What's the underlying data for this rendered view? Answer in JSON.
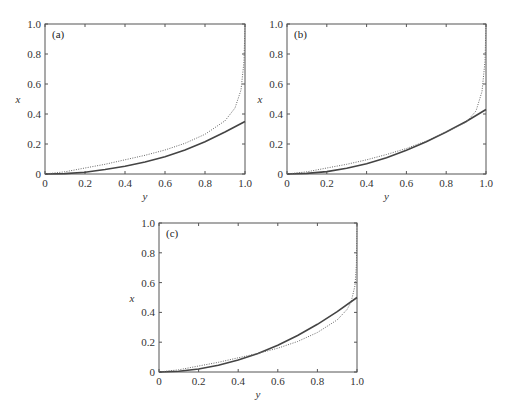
{
  "chart_data": [
    {
      "type": "line",
      "panel_label": "(a)",
      "xlabel": "y",
      "ylabel": "x",
      "xlim": [
        0,
        1.0
      ],
      "ylim": [
        0,
        1.0
      ],
      "x_ticks": [
        "0",
        "0.2",
        "0.4",
        "0.6",
        "0.8",
        "1.0"
      ],
      "y_ticks": [
        "0",
        "0.2",
        "0.4",
        "0.6",
        "0.8",
        "1.0"
      ],
      "grid": false,
      "legend": null,
      "series": [
        {
          "name": "solid",
          "style": "solid",
          "x": [
            0,
            0.1,
            0.2,
            0.3,
            0.4,
            0.5,
            0.6,
            0.7,
            0.8,
            0.9,
            1.0
          ],
          "y": [
            0,
            0.003,
            0.012,
            0.03,
            0.052,
            0.08,
            0.115,
            0.16,
            0.215,
            0.28,
            0.35
          ]
        },
        {
          "name": "dotted",
          "style": "dotted",
          "x": [
            0,
            0.1,
            0.2,
            0.3,
            0.4,
            0.5,
            0.6,
            0.7,
            0.8,
            0.9,
            0.95,
            0.98,
            0.995,
            1.0
          ],
          "y": [
            0,
            0.015,
            0.04,
            0.065,
            0.095,
            0.125,
            0.16,
            0.205,
            0.265,
            0.355,
            0.44,
            0.56,
            0.75,
            1.0
          ]
        }
      ]
    },
    {
      "type": "line",
      "panel_label": "(b)",
      "xlabel": "y",
      "ylabel": "x",
      "xlim": [
        0,
        1.0
      ],
      "ylim": [
        0,
        1.0
      ],
      "x_ticks": [
        "0",
        "0.2",
        "0.4",
        "0.6",
        "0.8",
        "1.0"
      ],
      "y_ticks": [
        "0",
        "0.2",
        "0.4",
        "0.6",
        "0.8",
        "1.0"
      ],
      "grid": false,
      "legend": null,
      "series": [
        {
          "name": "solid",
          "style": "solid",
          "x": [
            0,
            0.1,
            0.2,
            0.3,
            0.4,
            0.5,
            0.6,
            0.7,
            0.8,
            0.9,
            1.0
          ],
          "y": [
            0,
            0.004,
            0.016,
            0.038,
            0.068,
            0.108,
            0.158,
            0.215,
            0.28,
            0.35,
            0.43
          ]
        },
        {
          "name": "dotted",
          "style": "dotted",
          "x": [
            0,
            0.1,
            0.2,
            0.3,
            0.4,
            0.5,
            0.6,
            0.7,
            0.8,
            0.9,
            0.95,
            0.98,
            0.995,
            1.0
          ],
          "y": [
            0,
            0.015,
            0.04,
            0.065,
            0.095,
            0.13,
            0.17,
            0.22,
            0.28,
            0.345,
            0.42,
            0.55,
            0.75,
            1.0
          ]
        }
      ]
    },
    {
      "type": "line",
      "panel_label": "(c)",
      "xlabel": "y",
      "ylabel": "x",
      "xlim": [
        0,
        1.0
      ],
      "ylim": [
        0,
        1.0
      ],
      "x_ticks": [
        "0",
        "0.2",
        "0.4",
        "0.6",
        "0.8",
        "1.0"
      ],
      "y_ticks": [
        "0",
        "0.2",
        "0.4",
        "0.6",
        "0.8",
        "1.0"
      ],
      "grid": false,
      "legend": null,
      "series": [
        {
          "name": "solid",
          "style": "solid",
          "x": [
            0,
            0.1,
            0.2,
            0.3,
            0.4,
            0.5,
            0.6,
            0.7,
            0.8,
            0.9,
            1.0
          ],
          "y": [
            0,
            0.005,
            0.02,
            0.045,
            0.08,
            0.125,
            0.18,
            0.245,
            0.32,
            0.405,
            0.5
          ]
        },
        {
          "name": "dotted",
          "style": "dotted",
          "x": [
            0,
            0.1,
            0.2,
            0.3,
            0.4,
            0.5,
            0.6,
            0.7,
            0.8,
            0.9,
            0.95,
            0.97,
            0.99,
            0.997,
            1.0
          ],
          "y": [
            0,
            0.015,
            0.04,
            0.065,
            0.095,
            0.125,
            0.16,
            0.205,
            0.265,
            0.35,
            0.42,
            0.47,
            0.58,
            0.72,
            1.0
          ]
        }
      ]
    }
  ],
  "panels": [
    {
      "label": "(a)",
      "xlabel": "y",
      "ylabel": "x"
    },
    {
      "label": "(b)",
      "xlabel": "y",
      "ylabel": "x"
    },
    {
      "label": "(c)",
      "xlabel": "y",
      "ylabel": "x"
    }
  ],
  "layout": [
    {
      "left": 45,
      "top": 24,
      "width": 200,
      "height": 150
    },
    {
      "left": 287,
      "top": 24,
      "width": 199,
      "height": 150
    },
    {
      "left": 159,
      "top": 223,
      "width": 198,
      "height": 149
    }
  ]
}
